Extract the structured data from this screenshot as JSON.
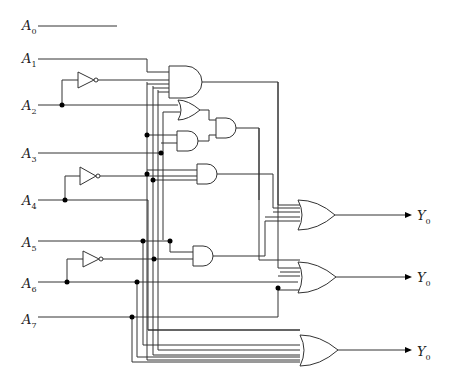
{
  "diagram": {
    "type": "logic-circuit",
    "inputs": [
      {
        "name": "A",
        "sub": "0"
      },
      {
        "name": "A",
        "sub": "1"
      },
      {
        "name": "A",
        "sub": "2"
      },
      {
        "name": "A",
        "sub": "3"
      },
      {
        "name": "A",
        "sub": "4"
      },
      {
        "name": "A",
        "sub": "5"
      },
      {
        "name": "A",
        "sub": "6"
      },
      {
        "name": "A",
        "sub": "7"
      }
    ],
    "outputs": [
      {
        "name": "Y",
        "sub": "0"
      },
      {
        "name": "Y",
        "sub": "0"
      },
      {
        "name": "Y",
        "sub": "0"
      }
    ],
    "gates": [
      {
        "id": "not1",
        "type": "NOT",
        "input": "A2"
      },
      {
        "id": "and1",
        "type": "AND",
        "inputs": 4
      },
      {
        "id": "or1",
        "type": "OR",
        "inputs": 2
      },
      {
        "id": "and2",
        "type": "AND",
        "inputs": 2
      },
      {
        "id": "and3",
        "type": "AND",
        "inputs": 2
      },
      {
        "id": "not2",
        "type": "NOT",
        "input": "A4"
      },
      {
        "id": "and4",
        "type": "AND",
        "inputs": 3
      },
      {
        "id": "not3",
        "type": "NOT",
        "input": "A6"
      },
      {
        "id": "and5",
        "type": "AND",
        "inputs": 2
      },
      {
        "id": "or2",
        "type": "OR",
        "inputs": 4,
        "output": "Y0"
      },
      {
        "id": "or3",
        "type": "OR",
        "inputs": 3,
        "output": "Y0"
      },
      {
        "id": "or4",
        "type": "OR",
        "inputs": 4,
        "output": "Y0"
      }
    ]
  }
}
